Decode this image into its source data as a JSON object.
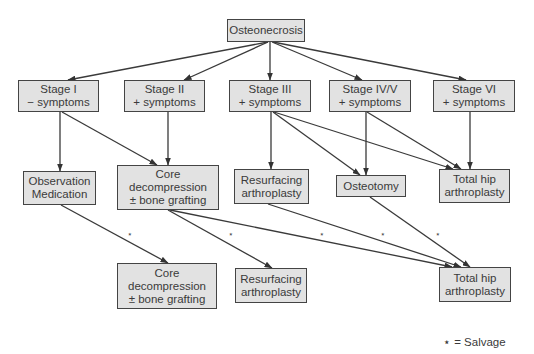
{
  "diagram": {
    "nodes": {
      "root": {
        "lines": [
          "Osteonecrosis"
        ]
      },
      "stage1": {
        "lines": [
          "Stage I",
          "− symptoms"
        ]
      },
      "stage2": {
        "lines": [
          "Stage II",
          "+ symptoms"
        ]
      },
      "stage3": {
        "lines": [
          "Stage III",
          "+ symptoms"
        ]
      },
      "stage45": {
        "lines": [
          "Stage IV/V",
          "+ symptoms"
        ]
      },
      "stage6": {
        "lines": [
          "Stage VI",
          "+ symptoms"
        ]
      },
      "observation": {
        "lines": [
          "Observation",
          "Medication"
        ]
      },
      "core1": {
        "lines": [
          "Core",
          "decompression",
          "± bone grafting"
        ]
      },
      "resurf1": {
        "lines": [
          "Resurfacing",
          "arthroplasty"
        ]
      },
      "osteotomy": {
        "lines": [
          "Osteotomy"
        ]
      },
      "thr1": {
        "lines": [
          "Total hip",
          "arthroplasty"
        ]
      },
      "core2": {
        "lines": [
          "Core",
          "decompression",
          "± bone grafting"
        ]
      },
      "resurf2": {
        "lines": [
          "Resurfacing",
          "arthroplasty"
        ]
      },
      "thr2": {
        "lines": [
          "Total hip",
          "arthroplasty"
        ]
      }
    },
    "edges": [
      {
        "from": "root",
        "to": "stage1"
      },
      {
        "from": "root",
        "to": "stage2"
      },
      {
        "from": "root",
        "to": "stage3"
      },
      {
        "from": "root",
        "to": "stage45"
      },
      {
        "from": "root",
        "to": "stage6"
      },
      {
        "from": "stage1",
        "to": "observation"
      },
      {
        "from": "stage1",
        "to": "core1"
      },
      {
        "from": "stage2",
        "to": "core1"
      },
      {
        "from": "stage3",
        "to": "resurf1"
      },
      {
        "from": "stage3",
        "to": "osteotomy"
      },
      {
        "from": "stage3",
        "to": "thr1"
      },
      {
        "from": "stage45",
        "to": "osteotomy"
      },
      {
        "from": "stage45",
        "to": "thr1"
      },
      {
        "from": "stage6",
        "to": "thr1"
      },
      {
        "from": "observation",
        "to": "core2",
        "salvage": true
      },
      {
        "from": "core1",
        "to": "resurf2",
        "salvage": true
      },
      {
        "from": "core1",
        "to": "thr2",
        "salvage": true
      },
      {
        "from": "resurf1",
        "to": "thr2",
        "salvage": true
      },
      {
        "from": "osteotomy",
        "to": "thr2",
        "salvage": true
      }
    ],
    "salvage_marker": "⋆",
    "legend": "⋆ = Salvage"
  }
}
